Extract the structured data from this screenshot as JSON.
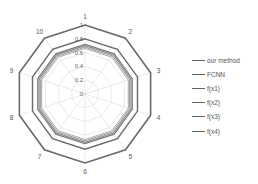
{
  "chart_data": {
    "type": "radar",
    "title": "",
    "categories": [
      "1",
      "2",
      "3",
      "4",
      "5",
      "6",
      "7",
      "8",
      "9",
      "10"
    ],
    "radial_ticks": [
      "0",
      "0.2",
      "0.4",
      "0.6",
      "0.8",
      "1"
    ],
    "rlim": [
      0,
      1
    ],
    "grid": true,
    "legend_position": "right",
    "series": [
      {
        "name": "our method",
        "values": [
          1,
          1,
          1,
          1,
          1,
          1,
          1,
          1,
          1,
          1
        ],
        "color": "#6a6a6a",
        "width": 1.6
      },
      {
        "name": "FCNN",
        "values": [
          0.8,
          0.8,
          0.8,
          0.8,
          0.8,
          0.8,
          0.8,
          0.8,
          0.8,
          0.8
        ],
        "color": "#6a6a6a",
        "width": 1.4
      },
      {
        "name": "f(x1)",
        "values": [
          0.72,
          0.72,
          0.72,
          0.72,
          0.72,
          0.72,
          0.72,
          0.72,
          0.72,
          0.72
        ],
        "color": "#7a7a7a",
        "width": 1.2
      },
      {
        "name": "f(x2)",
        "values": [
          0.7,
          0.7,
          0.7,
          0.7,
          0.7,
          0.7,
          0.7,
          0.7,
          0.7,
          0.7
        ],
        "color": "#8a8a8a",
        "width": 1.2
      },
      {
        "name": "f(x3)",
        "values": [
          0.68,
          0.68,
          0.68,
          0.68,
          0.68,
          0.68,
          0.68,
          0.68,
          0.68,
          0.68
        ],
        "color": "#999999",
        "width": 1.0
      },
      {
        "name": "f(x4)",
        "values": [
          0.66,
          0.66,
          0.66,
          0.66,
          0.66,
          0.66,
          0.66,
          0.66,
          0.66,
          0.66
        ],
        "color": "#a8a8a8",
        "width": 1.0
      }
    ]
  },
  "legend": {
    "items": [
      "our method",
      "FCNN",
      "f(x1)",
      "f(x2)",
      "f(x3)",
      "f(x4)"
    ]
  }
}
